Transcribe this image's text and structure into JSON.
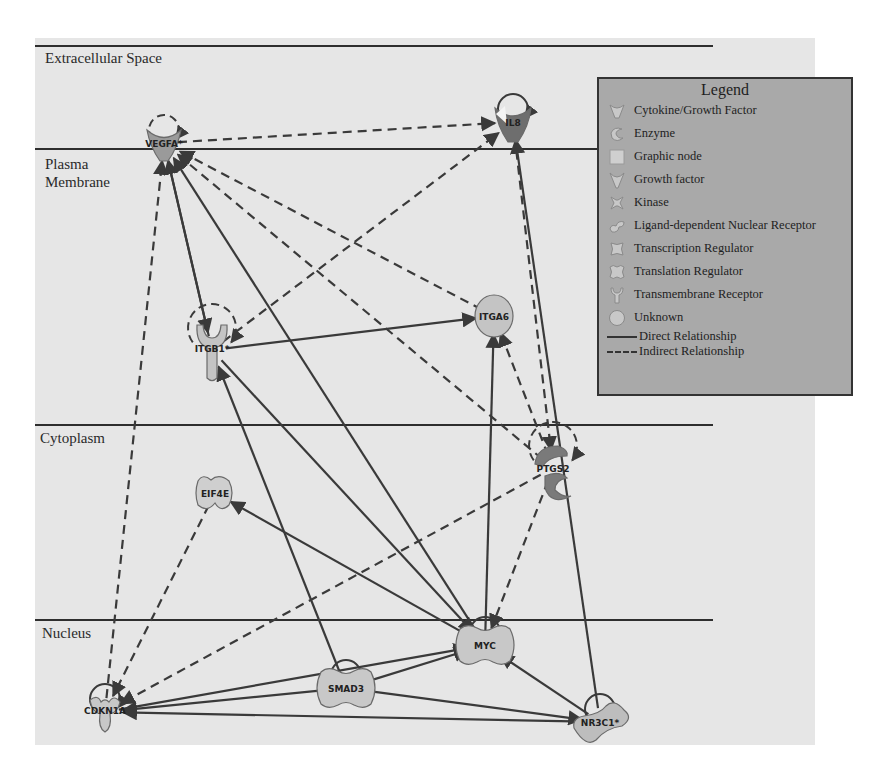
{
  "compartments": [
    {
      "label": "Extracellular Space",
      "line_y": 46,
      "label_x": 45,
      "label_y": 50
    },
    {
      "label": "Plasma Membrane",
      "line_y": 149,
      "label_x": 45,
      "label_y": 155
    },
    {
      "label": "Cytoplasm",
      "line_y": 425,
      "label_x": 40,
      "label_y": 429
    },
    {
      "label": "Nucleus",
      "line_y": 620,
      "label_x": 42,
      "label_y": 624
    }
  ],
  "nodes": [
    {
      "id": "VEGFA",
      "label": "VEGFA*",
      "type": "growth-factor",
      "x": 164,
      "y": 143,
      "fill": "#9a9a9a"
    },
    {
      "id": "IL8",
      "label": "IL8",
      "type": "cytokine",
      "x": 513,
      "y": 122,
      "fill": "#6e6e6e"
    },
    {
      "id": "ITGB1",
      "label": "ITGB1*",
      "type": "transmembrane-receptor",
      "x": 212,
      "y": 350,
      "fill": "#c4c4c4"
    },
    {
      "id": "ITGA6",
      "label": "ITGA6",
      "type": "unknown",
      "x": 494,
      "y": 316,
      "fill": "#c4c4c4"
    },
    {
      "id": "EIF4E",
      "label": "EIF4E",
      "type": "translation-regulator",
      "x": 215,
      "y": 493,
      "fill": "#cfcfcf"
    },
    {
      "id": "PTGS2",
      "label": "PTGS2",
      "type": "enzyme",
      "x": 553,
      "y": 468,
      "fill": "#7a7a7a"
    },
    {
      "id": "MYC",
      "label": "MYC",
      "type": "transcription-regulator",
      "x": 485,
      "y": 645,
      "fill": "#c8c8c8"
    },
    {
      "id": "SMAD3",
      "label": "SMAD3",
      "type": "transcription-regulator",
      "x": 346,
      "y": 688,
      "fill": "#c8c8c8"
    },
    {
      "id": "CDKN1A",
      "label": "CDKN1A",
      "type": "kinase",
      "x": 105,
      "y": 712,
      "fill": "#c8c8c8"
    },
    {
      "id": "NR3C1",
      "label": "NR3C1*",
      "type": "ligand-dependent-nuclear-receptor",
      "x": 600,
      "y": 722,
      "fill": "#bdbdbd"
    }
  ],
  "edges": [
    {
      "from": "VEGFA",
      "to": "IL8",
      "kind": "indirect"
    },
    {
      "from": "ITGB1",
      "to": "IL8",
      "kind": "indirect"
    },
    {
      "from": "ITGA6",
      "to": "VEGFA",
      "kind": "indirect"
    },
    {
      "from": "PTGS2",
      "to": "VEGFA",
      "kind": "indirect"
    },
    {
      "from": "CDKN1A",
      "to": "VEGFA",
      "kind": "indirect"
    },
    {
      "from": "VEGFA",
      "to": "ITGB1",
      "kind": "direct"
    },
    {
      "from": "ITGB1",
      "to": "VEGFA",
      "kind": "direct"
    },
    {
      "from": "MYC",
      "to": "VEGFA",
      "kind": "direct"
    },
    {
      "from": "ITGB1",
      "to": "ITGA6",
      "kind": "direct"
    },
    {
      "from": "MYC",
      "to": "ITGA6",
      "kind": "direct"
    },
    {
      "from": "PTGS2",
      "to": "ITGA6",
      "kind": "indirect"
    },
    {
      "from": "IL8",
      "to": "PTGS2",
      "kind": "indirect"
    },
    {
      "from": "NR3C1",
      "to": "IL8",
      "kind": "direct"
    },
    {
      "from": "SMAD3",
      "to": "ITGB1",
      "kind": "direct"
    },
    {
      "from": "MYC",
      "to": "EIF4E",
      "kind": "direct"
    },
    {
      "from": "EIF4E",
      "to": "CDKN1A",
      "kind": "indirect"
    },
    {
      "from": "PTGS2",
      "to": "CDKN1A",
      "kind": "indirect"
    },
    {
      "from": "PTGS2",
      "to": "MYC",
      "kind": "indirect"
    },
    {
      "from": "ITGB1",
      "to": "MYC",
      "kind": "direct"
    },
    {
      "from": "SMAD3",
      "to": "MYC",
      "kind": "direct"
    },
    {
      "from": "CDKN1A",
      "to": "MYC",
      "kind": "direct"
    },
    {
      "from": "NR3C1",
      "to": "MYC",
      "kind": "direct"
    },
    {
      "from": "SMAD3",
      "to": "CDKN1A",
      "kind": "direct"
    },
    {
      "from": "NR3C1",
      "to": "CDKN1A",
      "kind": "direct"
    },
    {
      "from": "SMAD3",
      "to": "NR3C1",
      "kind": "direct"
    }
  ],
  "self_loops": [
    {
      "node": "VEGFA",
      "kind": "indirect"
    },
    {
      "node": "IL8",
      "kind": "direct"
    },
    {
      "node": "ITGB1",
      "kind": "indirect"
    },
    {
      "node": "PTGS2",
      "kind": "indirect"
    },
    {
      "node": "MYC",
      "kind": "direct"
    },
    {
      "node": "SMAD3",
      "kind": "direct"
    },
    {
      "node": "CDKN1A",
      "kind": "direct"
    },
    {
      "node": "NR3C1",
      "kind": "direct"
    }
  ],
  "legend": {
    "title": "Legend",
    "items": [
      {
        "label": "Cytokine/Growth Factor",
        "icon": "cytokine-icon"
      },
      {
        "label": "Enzyme",
        "icon": "enzyme-icon"
      },
      {
        "label": "Graphic node",
        "icon": "graphic-node-icon"
      },
      {
        "label": "Growth factor",
        "icon": "growth-factor-icon"
      },
      {
        "label": "Kinase",
        "icon": "kinase-icon"
      },
      {
        "label": "Ligand-dependent Nuclear Receptor",
        "icon": "nuclear-receptor-icon"
      },
      {
        "label": "Transcription Regulator",
        "icon": "transcription-regulator-icon"
      },
      {
        "label": "Translation Regulator",
        "icon": "translation-regulator-icon"
      },
      {
        "label": "Transmembrane Receptor",
        "icon": "transmembrane-receptor-icon"
      },
      {
        "label": "Unknown",
        "icon": "unknown-icon"
      }
    ],
    "relationships": [
      {
        "label": "Direct Relationship",
        "style": "solid"
      },
      {
        "label": "Indirect Relationship",
        "style": "dashed"
      }
    ]
  },
  "colors": {
    "background": "#e6e6e6",
    "line": "#3a3a3a",
    "legend_bg": "#a9a9a9"
  }
}
